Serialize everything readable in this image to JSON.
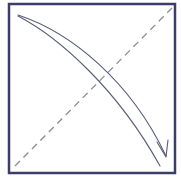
{
  "diagram": {
    "type": "origami-fold-instruction",
    "colors": {
      "background": "#ffffff",
      "border": "#3b3f68",
      "fold_line": "#8a8c99",
      "arrow": "#5a5d78"
    },
    "square": {
      "x": 9,
      "y": 4,
      "width": 166,
      "height": 169
    },
    "fold_line": {
      "style": "dashed",
      "x1": 15,
      "y1": 166,
      "x2": 172,
      "y2": 8
    },
    "arrow": {
      "style": "double-line-curved",
      "start": [
        18,
        16
      ],
      "end": [
        166,
        158
      ]
    }
  }
}
